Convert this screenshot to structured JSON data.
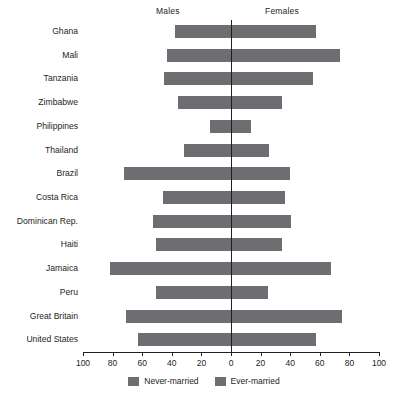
{
  "header": {
    "males_label": "Males",
    "females_label": "Females"
  },
  "legend": {
    "items": [
      {
        "label": "Never-married",
        "color": "#6d6e71"
      },
      {
        "label": "Ever-married",
        "color": "#6d6e71"
      }
    ]
  },
  "axis": {
    "tick_labels": [
      "100",
      "80",
      "60",
      "40",
      "20",
      "0",
      "20",
      "40",
      "60",
      "80",
      "100"
    ],
    "tick_values": [
      -100,
      -80,
      -60,
      -40,
      -20,
      0,
      20,
      40,
      60,
      80,
      100
    ]
  },
  "chart_data": {
    "type": "bar",
    "orientation": "horizontal",
    "style": "diverging-population-pyramid",
    "title": "",
    "xlabel": "",
    "ylabel": "",
    "xlim": [
      -100,
      100
    ],
    "grid": false,
    "legend_position": "bottom-center",
    "left_side_label": "Males",
    "right_side_label": "Females",
    "categories": [
      "Ghana",
      "Mali",
      "Tanzania",
      "Zimbabwe",
      "Philippines",
      "Thailand",
      "Brazil",
      "Costa Rica",
      "Dominican Rep.",
      "Haiti",
      "Jamaica",
      "Peru",
      "Great Britain",
      "United States"
    ],
    "series": [
      {
        "name": "Males",
        "side": "left",
        "values": [
          38,
          43,
          45,
          36,
          14,
          32,
          72,
          46,
          53,
          51,
          82,
          51,
          71,
          63
        ]
      },
      {
        "name": "Females",
        "side": "right",
        "values": [
          57,
          73,
          55,
          34,
          13,
          25,
          39,
          36,
          40,
          34,
          67,
          24,
          74,
          57
        ]
      }
    ],
    "bar_color": "#6d6e71"
  }
}
